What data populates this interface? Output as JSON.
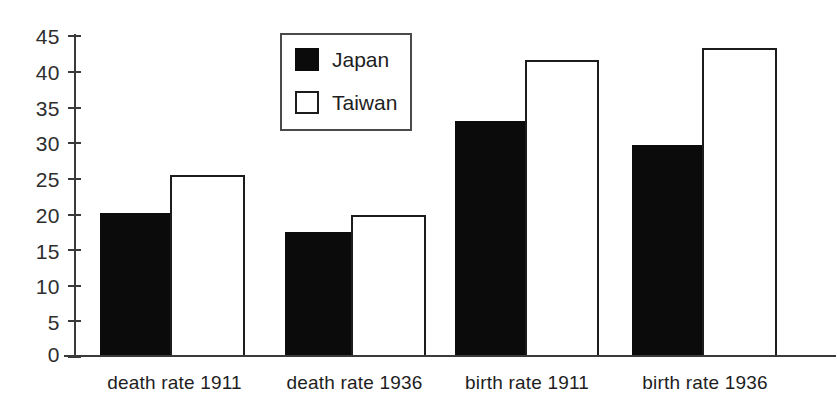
{
  "chart_data": {
    "type": "bar",
    "title": "",
    "subtitle": "",
    "xlabel": "",
    "ylabel": "",
    "categories": [
      "death rate 1911",
      "death rate 1936",
      "birth rate 1911",
      "birth rate 1936"
    ],
    "series": [
      {
        "name": "Japan",
        "color": "#0b0b0b",
        "fill": "solid-black",
        "values": [
          20.0,
          17.3,
          33.0,
          29.6
        ]
      },
      {
        "name": "Taiwan",
        "color": "#ffffff",
        "fill": "white-outlined",
        "values": [
          25.4,
          19.8,
          41.6,
          43.3
        ]
      }
    ],
    "ylim": [
      0,
      45
    ],
    "y_ticks": [
      0,
      5,
      10,
      15,
      20,
      25,
      30,
      35,
      40,
      45
    ],
    "y_tick_labels": [
      "0",
      "5",
      "10",
      "15",
      "20",
      "25",
      "30",
      "35",
      "40",
      "45"
    ],
    "grid": false,
    "legend_position": "top-center-inside",
    "legend_entries": [
      "Japan",
      "Taiwan"
    ],
    "annotations": []
  },
  "legend": {
    "items": [
      {
        "label": "Japan",
        "swatch": "filled-square-swatch"
      },
      {
        "label": "Taiwan",
        "swatch": "outlined-square-swatch"
      }
    ]
  },
  "axes": {
    "y_tick_labels": [
      "45",
      "40",
      "35",
      "30",
      "25",
      "20",
      "15",
      "10",
      "5",
      "0"
    ],
    "category_labels": [
      "death rate 1911",
      "death rate 1936",
      "birth rate 1911",
      "birth rate 1936"
    ]
  }
}
